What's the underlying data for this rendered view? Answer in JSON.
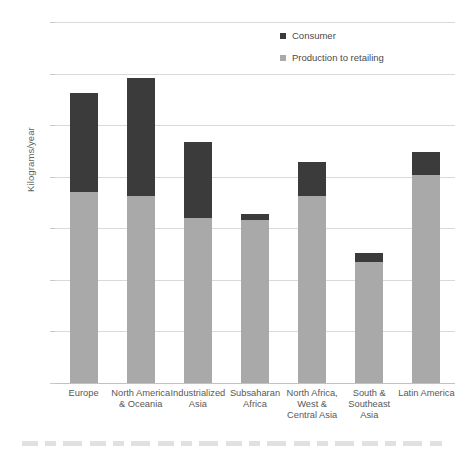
{
  "chart_data": {
    "type": "bar",
    "stacked": true,
    "title": "",
    "xlabel": "",
    "ylabel": "Kilograms/year",
    "ylim": [
      0,
      350
    ],
    "yticks": [
      0,
      50,
      100,
      150,
      200,
      250,
      300,
      350
    ],
    "grid": true,
    "legend_position": "top-right",
    "categories": [
      "Europe",
      "North America & Oceania",
      "Industrialized Asia",
      "Subsaharan Africa",
      "North Africa, West & Central Asia",
      "South & Southeast Asia",
      "Latin America"
    ],
    "category_lines": [
      [
        "Europe"
      ],
      [
        "North America",
        "& Oceania"
      ],
      [
        "Industrialized",
        "Asia"
      ],
      [
        "Subsaharan",
        "Africa"
      ],
      [
        "North Africa,",
        "West &",
        "Central Asia"
      ],
      [
        "South &",
        "Southeast",
        "Asia"
      ],
      [
        "Latin America"
      ]
    ],
    "series": [
      {
        "name": "Production to retailing",
        "color": "#a9a9a9",
        "values": [
          185,
          181,
          160,
          158,
          181,
          117,
          202
        ]
      },
      {
        "name": "Consumer",
        "color": "#3b3b3b",
        "values": [
          96,
          115,
          74,
          6,
          33,
          9,
          22
        ]
      }
    ],
    "totals": [
      281,
      296,
      234,
      164,
      214,
      126,
      224
    ]
  },
  "legend": {
    "items": [
      {
        "label": "Consumer",
        "color": "#3b3b3b"
      },
      {
        "label": "Production to retailing",
        "color": "#a9a9a9"
      }
    ]
  },
  "axis": {
    "y_title": "Kilograms/year",
    "y_tick_labels": [
      "350",
      "300",
      "250",
      "200",
      "150",
      "100",
      "50",
      "0"
    ]
  },
  "colors": {
    "consumer": "#3b3b3b",
    "production": "#a9a9a9",
    "gridline": "#d9d9d9",
    "text": "#6b6b6b",
    "background": "#ffffff"
  }
}
